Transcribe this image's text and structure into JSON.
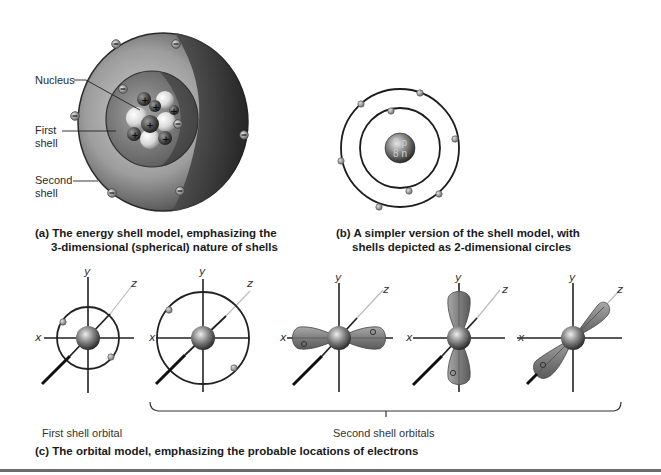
{
  "figure": {
    "panel_a": {
      "caption_letter": "(a)",
      "caption_line1": "The energy shell model, emphasizing the",
      "caption_line2": "3-dimensional (spherical) nature of shells",
      "labels": {
        "nucleus": "Nucleus",
        "first_shell_1": "First",
        "first_shell_2": "shell",
        "second_shell_1": "Second",
        "second_shell_2": "shell"
      },
      "electron_symbol": "−",
      "proton_symbol": "+",
      "electrons_shown": 9,
      "protons_shown": 6
    },
    "panel_b": {
      "caption_letter": "(b)",
      "caption_line1": "A simpler version of the shell model, with",
      "caption_line2": "shells depicted as 2-dimensional  circles",
      "nucleus_protons": "8 p",
      "nucleus_neutrons": "8 n",
      "inner_shell_electrons": 2,
      "outer_shell_electrons": 6
    },
    "panel_c": {
      "caption_letter": "(c)",
      "caption_text": "The orbital model, emphasizing the probable locations of electrons",
      "first_shell_label": "First shell orbital",
      "second_shell_label": "Second shell orbitals",
      "axes": {
        "x": "x",
        "y": "y",
        "z": "z"
      },
      "orbitals": [
        {
          "name": "1s",
          "type": "sphere"
        },
        {
          "name": "2s",
          "type": "sphere"
        },
        {
          "name": "2px",
          "type": "dumbbell-x"
        },
        {
          "name": "2py",
          "type": "dumbbell-y"
        },
        {
          "name": "2pz",
          "type": "dumbbell-z"
        }
      ]
    },
    "colors": {
      "line": "#1a1a1a",
      "lobe": "#8a8a8a",
      "electron": "#9a9a9a",
      "nucleus": "#555555",
      "rule": "#6b6b6b"
    }
  }
}
